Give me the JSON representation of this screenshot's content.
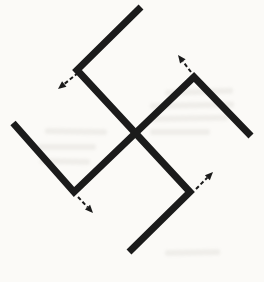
{
  "figure": {
    "canvas": {
      "width": 264,
      "height": 282
    },
    "colors": {
      "background": "#fbfaf7",
      "stroke": "#1b1b1b",
      "showthrough": "#a9a49b"
    },
    "main_stroke_width": 7,
    "polylines": [
      {
        "name": "arm-top-hook-nw-se-diagonal-bottom-hook",
        "points": [
          [
            141,
            7
          ],
          [
            77,
            70
          ],
          [
            190,
            192
          ],
          [
            129,
            252
          ]
        ]
      },
      {
        "name": "arm-left-hook-sw-ne-diagonal-right-hook",
        "points": [
          [
            13,
            123
          ],
          [
            74,
            192
          ],
          [
            194,
            77
          ],
          [
            251,
            136
          ]
        ]
      }
    ],
    "arrows": [
      {
        "name": "nw-rotation-arrow",
        "direction": "down-left",
        "from": [
          78,
          73
        ],
        "tip": [
          58,
          89
        ]
      },
      {
        "name": "ne-rotation-arrow",
        "direction": "up-left",
        "from": [
          191,
          72
        ],
        "tip": [
          178,
          55
        ]
      },
      {
        "name": "se-rotation-arrow",
        "direction": "up-right",
        "from": [
          196,
          189
        ],
        "tip": [
          213,
          172
        ]
      },
      {
        "name": "sw-rotation-arrow",
        "direction": "down-right",
        "from": [
          78,
          197
        ],
        "tip": [
          93,
          213
        ]
      }
    ],
    "arrow_style": {
      "stroke_width": 2,
      "dash": "4 2.5",
      "head_length": 8,
      "head_width": 7
    },
    "showthrough_smudges": [
      {
        "x": 165,
        "y": 90,
        "w": 68,
        "h": 6,
        "rot": -2
      },
      {
        "x": 150,
        "y": 103,
        "w": 84,
        "h": 6,
        "rot": -1
      },
      {
        "x": 150,
        "y": 116,
        "w": 78,
        "h": 6,
        "rot": -1
      },
      {
        "x": 45,
        "y": 128,
        "w": 62,
        "h": 6,
        "rot": 1
      },
      {
        "x": 150,
        "y": 129,
        "w": 60,
        "h": 6,
        "rot": 0
      },
      {
        "x": 38,
        "y": 144,
        "w": 58,
        "h": 6,
        "rot": 0
      },
      {
        "x": 40,
        "y": 158,
        "w": 50,
        "h": 6,
        "rot": 1
      },
      {
        "x": 165,
        "y": 250,
        "w": 55,
        "h": 6,
        "rot": -1
      }
    ]
  }
}
